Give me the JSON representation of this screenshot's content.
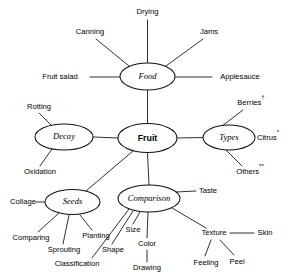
{
  "diagram": {
    "background_color": "#ffffff",
    "line_color": "#1a1a1a",
    "text_color": "#000000"
  },
  "center_node": {
    "label": "Fruit",
    "cx": 147.5,
    "cy": 138,
    "rx": 29.5,
    "ry": 14.5
  },
  "nodes": [
    {
      "id": "food",
      "label": "Food",
      "cx": 147.5,
      "cy": 76.5,
      "rx": 27.5,
      "ry": 13.5
    },
    {
      "id": "decay",
      "label": "Decay",
      "cx": 64,
      "cy": 137,
      "rx": 29,
      "ry": 13
    },
    {
      "id": "types",
      "label": "Types",
      "cx": 229,
      "cy": 137.5,
      "rx": 26,
      "ry": 12.5
    },
    {
      "id": "seeds",
      "label": "Seeds",
      "cx": 72.5,
      "cy": 202,
      "rx": 27.5,
      "ry": 12.5
    },
    {
      "id": "comparison",
      "label": "Comparison",
      "cx": 149,
      "cy": 198.5,
      "rx": 31,
      "ry": 13.5
    }
  ],
  "leaves": [
    {
      "id": "drying",
      "label": "Drying",
      "x": 147.5,
      "y": 12,
      "anchor": "middle",
      "sup": ""
    },
    {
      "id": "canning",
      "label": "Canning",
      "x": 90,
      "y": 32,
      "anchor": "middle",
      "sup": ""
    },
    {
      "id": "jams",
      "label": "Jams",
      "x": 209,
      "y": 32,
      "anchor": "middle",
      "sup": ""
    },
    {
      "id": "fruit-salad",
      "label": "Fruit salad",
      "x": 60,
      "y": 77,
      "anchor": "middle",
      "sup": ""
    },
    {
      "id": "applesauce",
      "label": "Applesauce",
      "x": 240,
      "y": 77,
      "anchor": "middle",
      "sup": ""
    },
    {
      "id": "rotting",
      "label": "Rotting",
      "x": 39,
      "y": 107,
      "anchor": "middle",
      "sup": ""
    },
    {
      "id": "oxidation",
      "label": "Oxidation",
      "x": 40,
      "y": 172,
      "anchor": "middle",
      "sup": ""
    },
    {
      "id": "berries",
      "label": "Berries",
      "x": 251,
      "y": 103,
      "anchor": "middle",
      "sup": "†"
    },
    {
      "id": "citrus",
      "label": "Citrus",
      "x": 268,
      "y": 138,
      "anchor": "middle",
      "sup": "*"
    },
    {
      "id": "others",
      "label": "Others",
      "x": 250,
      "y": 172,
      "anchor": "middle",
      "sup": "**"
    },
    {
      "id": "collage",
      "label": "Collage",
      "x": 23,
      "y": 202,
      "anchor": "middle",
      "sup": ""
    },
    {
      "id": "comparing",
      "label": "Comparing",
      "x": 31,
      "y": 238,
      "anchor": "middle",
      "sup": ""
    },
    {
      "id": "sprouting",
      "label": "Sprouting",
      "x": 64,
      "y": 250,
      "anchor": "middle",
      "sup": ""
    },
    {
      "id": "planting",
      "label": "Planting",
      "x": 96,
      "y": 236,
      "anchor": "middle",
      "sup": ""
    },
    {
      "id": "classification",
      "label": "Classification",
      "x": 77,
      "y": 264,
      "anchor": "middle",
      "sup": ""
    },
    {
      "id": "shape",
      "label": "Shape",
      "x": 113,
      "y": 250,
      "anchor": "middle",
      "sup": ""
    },
    {
      "id": "size",
      "label": "Size",
      "x": 133,
      "y": 230,
      "anchor": "middle",
      "sup": ""
    },
    {
      "id": "color",
      "label": "Color",
      "x": 147,
      "y": 244,
      "anchor": "middle",
      "sup": ""
    },
    {
      "id": "drawing",
      "label": "Drawing",
      "x": 147,
      "y": 268,
      "anchor": "middle",
      "sup": ""
    },
    {
      "id": "taste",
      "label": "Taste",
      "x": 208,
      "y": 191,
      "anchor": "middle",
      "sup": ""
    },
    {
      "id": "texture",
      "label": "Texture",
      "x": 214,
      "y": 233,
      "anchor": "middle",
      "sup": ""
    },
    {
      "id": "skin",
      "label": "Skin",
      "x": 265,
      "y": 233,
      "anchor": "middle",
      "sup": ""
    },
    {
      "id": "feeling",
      "label": "Feeling",
      "x": 206,
      "y": 263,
      "anchor": "middle",
      "sup": ""
    },
    {
      "id": "peel",
      "label": "Peel",
      "x": 237,
      "y": 262,
      "anchor": "middle",
      "sup": ""
    }
  ],
  "edges": [
    {
      "id": "fruit-food",
      "from": "Fruit",
      "to": "Food",
      "x1": 147.5,
      "y1": 123.5,
      "x2": 147.5,
      "y2": 90
    },
    {
      "id": "fruit-decay",
      "from": "Fruit",
      "to": "Decay",
      "x1": 118,
      "y1": 138,
      "x2": 93,
      "y2": 137
    },
    {
      "id": "fruit-types",
      "from": "Fruit",
      "to": "Types",
      "x1": 177,
      "y1": 138,
      "x2": 203,
      "y2": 137.5
    },
    {
      "id": "fruit-seeds",
      "from": "Fruit",
      "to": "Seeds",
      "x1": 133,
      "y1": 151,
      "x2": 86,
      "y2": 191
    },
    {
      "id": "fruit-comparison",
      "from": "Fruit",
      "to": "Comparison",
      "x1": 147.5,
      "y1": 152.5,
      "x2": 149,
      "y2": 185
    },
    {
      "id": "food-drying",
      "from": "Food",
      "to": "Drying",
      "x1": 147.5,
      "y1": 63,
      "x2": 147.5,
      "y2": 20
    },
    {
      "id": "food-canning",
      "from": "Food",
      "to": "Canning",
      "x1": 129,
      "y1": 66,
      "x2": 96,
      "y2": 39
    },
    {
      "id": "food-jams",
      "from": "Food",
      "to": "Jams",
      "x1": 166,
      "y1": 66,
      "x2": 203,
      "y2": 39
    },
    {
      "id": "food-fruit-salad",
      "from": "Food",
      "to": "Fruit salad",
      "x1": 120,
      "y1": 77,
      "x2": 90,
      "y2": 77
    },
    {
      "id": "food-applesauce",
      "from": "Food",
      "to": "Applesauce",
      "x1": 175,
      "y1": 77,
      "x2": 212,
      "y2": 77
    },
    {
      "id": "decay-rotting",
      "from": "Decay",
      "to": "Rotting",
      "x1": 52,
      "y1": 126,
      "x2": 39,
      "y2": 113
    },
    {
      "id": "decay-oxidation",
      "from": "Decay",
      "to": "Oxidation",
      "x1": 52,
      "y1": 149,
      "x2": 40,
      "y2": 166
    },
    {
      "id": "types-berries",
      "from": "Types",
      "to": "Berries",
      "x1": 222,
      "y1": 126,
      "x2": 243,
      "y2": 110
    },
    {
      "id": "types-citrus",
      "from": "Types",
      "to": "Citrus",
      "x1": 255,
      "y1": 138,
      "x2": 255,
      "y2": 138
    },
    {
      "id": "types-others",
      "from": "Types",
      "to": "Others",
      "x1": 226,
      "y1": 150,
      "x2": 242,
      "y2": 166
    },
    {
      "id": "seeds-collage",
      "from": "Seeds",
      "to": "Collage",
      "x1": 45,
      "y1": 202,
      "x2": 36,
      "y2": 202
    },
    {
      "id": "seeds-comparing",
      "from": "Seeds",
      "to": "Comparing",
      "x1": 59,
      "y1": 213,
      "x2": 38,
      "y2": 232
    },
    {
      "id": "seeds-sprouting",
      "from": "Seeds",
      "to": "Sprouting",
      "x1": 69,
      "y1": 215,
      "x2": 63,
      "y2": 244
    },
    {
      "id": "seeds-planting",
      "from": "Seeds",
      "to": "Planting",
      "x1": 80,
      "y1": 215,
      "x2": 92,
      "y2": 230
    },
    {
      "id": "comparison-classific",
      "from": "Comparison",
      "to": "Classification",
      "x1": 129,
      "y1": 209,
      "x2": 92,
      "y2": 258
    },
    {
      "id": "comparison-shape",
      "from": "Comparison",
      "to": "Shape",
      "x1": 133,
      "y1": 211,
      "x2": 112,
      "y2": 244
    },
    {
      "id": "comparison-size",
      "from": "Comparison",
      "to": "Size",
      "x1": 140,
      "y1": 212,
      "x2": 133,
      "y2": 224
    },
    {
      "id": "comparison-color",
      "from": "Comparison",
      "to": "Color",
      "x1": 148,
      "y1": 212,
      "x2": 147,
      "y2": 238
    },
    {
      "id": "color-drawing",
      "from": "Color",
      "to": "Drawing",
      "x1": 147,
      "y1": 250,
      "x2": 147,
      "y2": 262
    },
    {
      "id": "comparison-taste",
      "from": "Comparison",
      "to": "Taste",
      "x1": 176,
      "y1": 192,
      "x2": 196,
      "y2": 191
    },
    {
      "id": "comparison-texture",
      "from": "Comparison",
      "to": "Texture",
      "x1": 172,
      "y1": 208,
      "x2": 206,
      "y2": 228
    },
    {
      "id": "texture-skin",
      "from": "Texture",
      "to": "Skin",
      "x1": 230,
      "y1": 233,
      "x2": 254,
      "y2": 233
    },
    {
      "id": "texture-feeling",
      "from": "Texture",
      "to": "Feeling",
      "x1": 211,
      "y1": 240,
      "x2": 205,
      "y2": 256
    },
    {
      "id": "texture-peel",
      "from": "Texture",
      "to": "Peel",
      "x1": 220,
      "y1": 240,
      "x2": 234,
      "y2": 255
    }
  ],
  "footnote_markers": {
    "dagger": "†",
    "single_star": "*",
    "double_star": "**"
  }
}
